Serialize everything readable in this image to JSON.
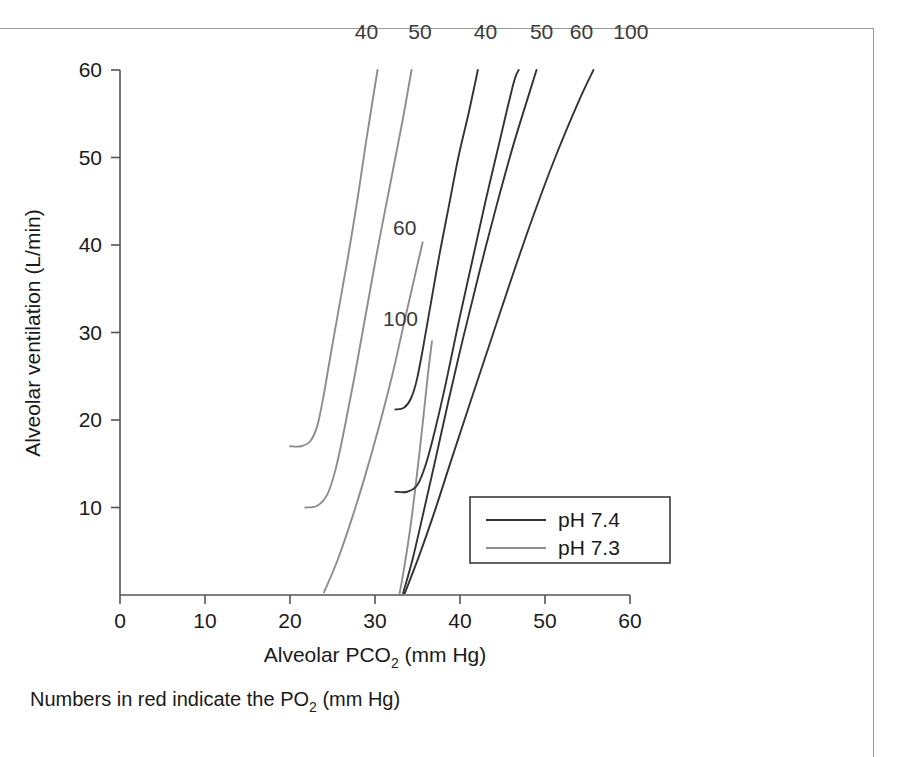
{
  "figure": {
    "caption": "Numbers in red indicate the PO",
    "caption_sub": "2",
    "caption_tail": " (mm Hg)",
    "border_color": "#9a9a9a"
  },
  "legend": {
    "position": "inside-lower-right",
    "items": [
      {
        "label": "pH 7.4",
        "color": "#333333"
      },
      {
        "label": "pH 7.3",
        "color": "#8d8d8d"
      }
    ]
  },
  "chart_data": {
    "type": "line",
    "title": "",
    "xlabel_main": "Alveolar PCO",
    "xlabel_sub": "2",
    "xlabel_tail": " (mm Hg)",
    "ylabel": "Alveolar ventilation (L/min)",
    "xlim": [
      0,
      60
    ],
    "ylim": [
      0,
      60
    ],
    "xticks": [
      0,
      10,
      20,
      30,
      40,
      50,
      60
    ],
    "yticks": [
      10,
      20,
      30,
      40,
      50,
      60
    ],
    "grid": false,
    "annotation_note": "Curve labels are PO2 values in mm Hg",
    "series": [
      {
        "name": "PO2 40, pH 7.3",
        "po2": 40,
        "ph": 7.3,
        "color": "#8d8d8d",
        "label": "40",
        "label_pos": "top",
        "label_xy": [
          29.0,
          63.5
        ],
        "points": [
          [
            20.0,
            17.0
          ],
          [
            21.3,
            17.0
          ],
          [
            22.4,
            17.6
          ],
          [
            23.2,
            19.3
          ],
          [
            23.9,
            22.5
          ],
          [
            24.7,
            27.0
          ],
          [
            25.7,
            32.5
          ],
          [
            26.8,
            38.5
          ],
          [
            27.9,
            45.0
          ],
          [
            28.9,
            51.5
          ],
          [
            29.8,
            57.0
          ],
          [
            30.3,
            60.0
          ]
        ]
      },
      {
        "name": "PO2 50, pH 7.3",
        "po2": 50,
        "ph": 7.3,
        "color": "#8d8d8d",
        "label": "50",
        "label_pos": "top",
        "label_xy": [
          35.3,
          63.5
        ],
        "points": [
          [
            21.8,
            10.0
          ],
          [
            23.2,
            10.2
          ],
          [
            24.4,
            11.5
          ],
          [
            25.4,
            14.5
          ],
          [
            26.4,
            19.0
          ],
          [
            27.6,
            25.0
          ],
          [
            28.9,
            32.0
          ],
          [
            30.3,
            39.5
          ],
          [
            31.8,
            47.0
          ],
          [
            33.2,
            54.0
          ],
          [
            34.3,
            60.0
          ]
        ]
      },
      {
        "name": "PO2 60, pH 7.3",
        "po2": 60,
        "ph": 7.3,
        "color": "#8d8d8d",
        "label": "60",
        "label_pos": "inline",
        "label_xy": [
          33.5,
          41.2
        ],
        "points": [
          [
            24.0,
            0.3
          ],
          [
            25.6,
            4.0
          ],
          [
            27.2,
            8.5
          ],
          [
            28.8,
            13.5
          ],
          [
            30.4,
            19.0
          ],
          [
            32.0,
            25.0
          ],
          [
            33.4,
            31.0
          ],
          [
            34.7,
            36.5
          ],
          [
            35.6,
            40.3
          ]
        ]
      },
      {
        "name": "PO2 100, pH 7.3",
        "po2": 100,
        "ph": 7.3,
        "color": "#8d8d8d",
        "label": "100",
        "label_pos": "inline",
        "label_xy": [
          33.0,
          30.7
        ],
        "points": [
          [
            32.9,
            0.2
          ],
          [
            33.5,
            3.5
          ],
          [
            34.2,
            8.0
          ],
          [
            34.9,
            13.5
          ],
          [
            35.6,
            19.5
          ],
          [
            36.2,
            25.0
          ],
          [
            36.7,
            29.0
          ]
        ]
      },
      {
        "name": "PO2 40, pH 7.4",
        "po2": 40,
        "ph": 7.4,
        "color": "#333333",
        "label": "40",
        "label_pos": "top",
        "label_xy": [
          43.0,
          63.5
        ],
        "points": [
          [
            32.4,
            21.2
          ],
          [
            33.4,
            21.4
          ],
          [
            34.2,
            22.4
          ],
          [
            34.9,
            24.5
          ],
          [
            35.7,
            28.5
          ],
          [
            36.6,
            33.5
          ],
          [
            37.6,
            39.0
          ],
          [
            38.7,
            44.5
          ],
          [
            39.8,
            50.0
          ],
          [
            41.0,
            55.0
          ],
          [
            42.1,
            60.0
          ]
        ]
      },
      {
        "name": "PO2 50, pH 7.4",
        "po2": 50,
        "ph": 7.4,
        "color": "#333333",
        "label": "50",
        "label_pos": "top",
        "label_xy": [
          49.6,
          63.5
        ],
        "points": [
          [
            32.4,
            11.8
          ],
          [
            33.8,
            11.8
          ],
          [
            35.0,
            12.6
          ],
          [
            36.0,
            15.0
          ],
          [
            37.1,
            19.0
          ],
          [
            38.4,
            24.5
          ],
          [
            39.8,
            31.0
          ],
          [
            41.4,
            38.0
          ],
          [
            43.0,
            45.0
          ],
          [
            44.7,
            52.0
          ],
          [
            46.3,
            58.5
          ],
          [
            46.9,
            60.0
          ]
        ]
      },
      {
        "name": "PO2 60, pH 7.4",
        "po2": 60,
        "ph": 7.4,
        "color": "#333333",
        "label": "60",
        "label_pos": "top",
        "label_xy": [
          54.3,
          63.5
        ],
        "points": [
          [
            33.3,
            0.2
          ],
          [
            34.4,
            4.0
          ],
          [
            35.6,
            9.0
          ],
          [
            37.0,
            15.0
          ],
          [
            38.6,
            22.0
          ],
          [
            40.4,
            29.5
          ],
          [
            42.3,
            37.0
          ],
          [
            44.3,
            44.5
          ],
          [
            46.3,
            51.5
          ],
          [
            48.2,
            57.5
          ],
          [
            49.0,
            60.0
          ]
        ]
      },
      {
        "name": "PO2 100, pH 7.4",
        "po2": 100,
        "ph": 7.4,
        "color": "#333333",
        "label": "100",
        "label_pos": "top",
        "label_xy": [
          60.1,
          63.5
        ],
        "points": [
          [
            33.5,
            0.2
          ],
          [
            35.2,
            4.5
          ],
          [
            37.0,
            9.5
          ],
          [
            39.0,
            15.5
          ],
          [
            41.2,
            22.0
          ],
          [
            43.6,
            29.0
          ],
          [
            46.0,
            36.0
          ],
          [
            48.5,
            43.0
          ],
          [
            51.2,
            50.0
          ],
          [
            54.0,
            56.5
          ],
          [
            55.7,
            60.0
          ]
        ]
      }
    ]
  }
}
